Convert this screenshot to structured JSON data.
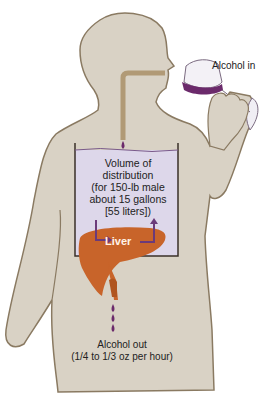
{
  "diagram": {
    "labels": {
      "alcohol_in": "Alcohol in",
      "volume": [
        "Volume of",
        "distribution",
        "(for 150-lb male",
        "about 15 gallons",
        "[55 liters])"
      ],
      "liver": "Liver",
      "alcohol_out": "Alcohol out",
      "alcohol_out_rate": "(1/4 to 1/3 oz per hour)"
    },
    "colors": {
      "body": "#d9d2c5",
      "outline": "#8a7a62",
      "tube": "#b19a76",
      "container_fill": "#ddd7ea",
      "liver": "#c8642a",
      "wine": "#6b2a6b",
      "arrow": "#6b3a7a"
    }
  }
}
